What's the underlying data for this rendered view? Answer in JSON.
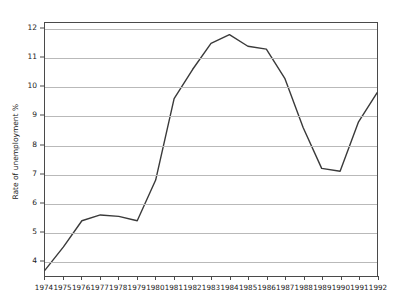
{
  "chart_data": {
    "type": "line",
    "title": "",
    "xlabel": "",
    "ylabel": "Rate of unemployment %",
    "x": [
      1974,
      1975,
      1976,
      1977,
      1978,
      1979,
      1980,
      1981,
      1982,
      1983,
      1984,
      1985,
      1986,
      1987,
      1988,
      1989,
      1990,
      1991,
      1992
    ],
    "categories": [
      "1974",
      "1975",
      "1976",
      "1977",
      "1978",
      "1979",
      "1980",
      "1981",
      "1982",
      "1983",
      "1984",
      "1985",
      "1986",
      "1987",
      "1988",
      "1989",
      "1990",
      "1991",
      "1992"
    ],
    "values": [
      3.7,
      4.5,
      5.4,
      5.6,
      5.55,
      5.4,
      6.8,
      9.6,
      10.6,
      11.5,
      11.8,
      11.4,
      11.3,
      10.3,
      8.6,
      7.2,
      7.1,
      8.8,
      9.8
    ],
    "series": [
      {
        "name": "Rate of unemployment %",
        "values": [
          3.7,
          4.5,
          5.4,
          5.6,
          5.55,
          5.4,
          6.8,
          9.6,
          10.6,
          11.5,
          11.8,
          11.4,
          11.3,
          10.3,
          8.6,
          7.2,
          7.1,
          8.8,
          9.8
        ]
      }
    ],
    "xlim": [
      1974,
      1992
    ],
    "ylim": [
      3.5,
      12.2
    ],
    "yticks": [
      4,
      5,
      6,
      7,
      8,
      9,
      10,
      11,
      12
    ],
    "ytick_labels": [
      "4",
      "5",
      "6",
      "7",
      "8",
      "9",
      "10",
      "11",
      "12"
    ],
    "grid": true,
    "grid_axis": "y",
    "legend": false,
    "legend_position": "none",
    "line_color": "#3a3a3a",
    "grid_color": "#b9b9b9",
    "axis_color": "#4a4a4a",
    "background_color": "#ffffff",
    "markers": false
  }
}
